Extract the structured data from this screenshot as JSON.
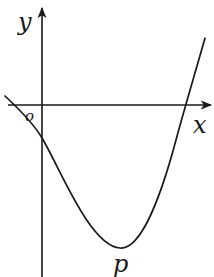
{
  "figure": {
    "type": "function-graph",
    "labels": {
      "y_axis": "y",
      "x_axis": "x",
      "origin": "o",
      "minimum_point": "p"
    },
    "colors": {
      "stroke": "#1a1a1a",
      "background": "#ffffff"
    }
  }
}
